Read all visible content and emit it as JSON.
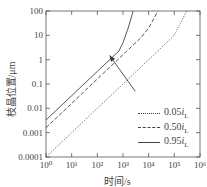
{
  "chart_data": {
    "type": "line",
    "title": "",
    "xlabel": "时间/s",
    "ylabel": "枝晶位置/μm",
    "xscale": "log",
    "yscale": "log",
    "xlim": [
      1,
      1000000
    ],
    "ylim": [
      0.0001,
      100
    ],
    "x_tick_labels": [
      "10⁰",
      "10¹",
      "10²",
      "10³",
      "10⁴",
      "10⁵",
      "10⁶"
    ],
    "y_tick_labels": [
      "100",
      "10",
      "1",
      "0.1",
      "0.01",
      "0.001",
      "0.0001"
    ],
    "grid": false,
    "legend_position": "lower right",
    "series": [
      {
        "name": "0.05iL",
        "style": "dotted",
        "x": [
          1,
          10,
          100,
          1000,
          10000,
          100000,
          300000
        ],
        "y": [
          0.0001,
          0.001,
          0.01,
          0.1,
          1,
          10,
          100
        ]
      },
      {
        "name": "0.50iL",
        "style": "dashed",
        "x": [
          1,
          10,
          100,
          1000,
          5000,
          10000,
          23000
        ],
        "y": [
          0.0016,
          0.016,
          0.16,
          1.6,
          8,
          20,
          100
        ]
      },
      {
        "name": "0.95iL",
        "style": "solid",
        "x": [
          1,
          10,
          100,
          700,
          1000,
          1600,
          2500
        ],
        "y": [
          0.0033,
          0.033,
          0.33,
          2.3,
          5,
          20,
          100
        ]
      }
    ],
    "annotations": [
      {
        "type": "arrow",
        "from": [
          3000,
          0.05
        ],
        "to": [
          300,
          1.5
        ],
        "meaning": "increasing current density"
      }
    ]
  },
  "axes": {
    "xlabel": "时间/s",
    "ylabel": "枝晶位置/μm",
    "x_ticks": [
      "10⁰",
      "10¹",
      "10²",
      "10³",
      "10⁴",
      "10⁵",
      "10⁶"
    ],
    "y_ticks": [
      "100",
      "10",
      "1",
      "0.1",
      "0.01",
      "0.001",
      "0.0001"
    ]
  },
  "legend": [
    {
      "coef": "0.05",
      "var": "i",
      "sub": "L",
      "style": "dotted"
    },
    {
      "coef": "0.50",
      "var": "i",
      "sub": "L",
      "style": "dashed"
    },
    {
      "coef": "0.95",
      "var": "i",
      "sub": "L",
      "style": "solid"
    }
  ]
}
